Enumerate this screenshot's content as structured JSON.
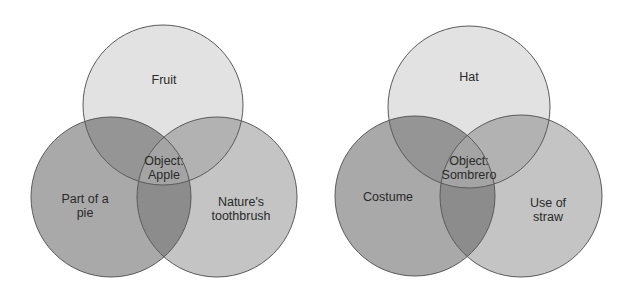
{
  "diagrams": [
    {
      "name": "apple-venn",
      "sets": [
        {
          "label": "Fruit",
          "cx": 163,
          "cy": 105,
          "r": 80
        },
        {
          "label": "Part of a pie",
          "cx": 111,
          "cy": 197,
          "r": 80
        },
        {
          "label": "Nature's toothbrush",
          "cx": 217,
          "cy": 197,
          "r": 80
        }
      ],
      "labels": {
        "top": "Fruit",
        "left_line1": "Part of a",
        "left_line2": "pie",
        "right_line1": "Nature's",
        "right_line2": "toothbrush",
        "center_line1": "Object:",
        "center_line2": "Apple"
      }
    },
    {
      "name": "sombrero-venn",
      "sets": [
        {
          "label": "Hat",
          "cx": 469,
          "cy": 107,
          "r": 81
        },
        {
          "label": "Costume",
          "cx": 415,
          "cy": 196,
          "r": 80
        },
        {
          "label": "Use of straw",
          "cx": 521,
          "cy": 196,
          "r": 81
        }
      ],
      "labels": {
        "top": "Hat",
        "left_line1": "Costume",
        "right_line1": "Use of",
        "right_line2": "straw",
        "center_line1": "Object:",
        "center_line2": "Sombrero"
      }
    }
  ],
  "colors": {
    "top": "#e2e2e2",
    "left": "#a9a9a9",
    "right": "#c4c4c4",
    "stroke": "#5a5a5a"
  }
}
